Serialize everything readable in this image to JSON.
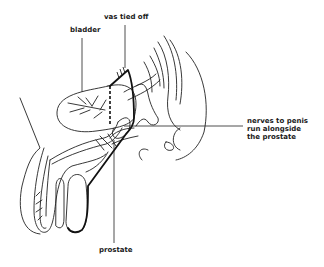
{
  "diagram": {
    "type": "anatomical line drawing",
    "line_color": "#222222",
    "background": "#ffffff"
  },
  "labels": {
    "bladder": "bladder",
    "vas": "vas tied off",
    "nerves": [
      "nerves to penis",
      "run alongside",
      "the prostate"
    ],
    "prostate": "prostate"
  }
}
